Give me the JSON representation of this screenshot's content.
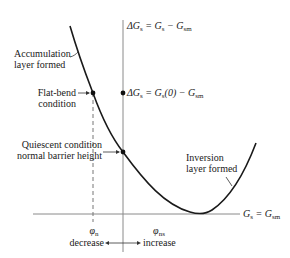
{
  "diagram": {
    "axis_label_vertical": {
      "prefix": "ΔG",
      "sub1": "s",
      "eq": " = G",
      "sub2": "s",
      "minus": " − G",
      "sub3": "sm"
    },
    "axis_label_horizontal": {
      "g": "G",
      "sub1": "s",
      "eq": " = G",
      "sub2": "sm"
    },
    "point_label": {
      "prefix": "ΔG",
      "sub1": "s",
      "eq": " = G",
      "sub2": "s",
      "paren": "(0) − G",
      "sub3": "sm"
    },
    "annotations": {
      "accumulation_line1": "Accumulation",
      "accumulation_line2": "layer formed",
      "flatband_line1": "Flat-bend",
      "flatband_line2": "condition",
      "quiescent_line1": "Quiescent condition",
      "quiescent_line2": "normal barrier height",
      "inversion_line1": "Inversion",
      "inversion_line2": "layer formed"
    },
    "ticks": {
      "phi_n": "φ",
      "phi_n_sub": "n",
      "phi_ns": "φ",
      "phi_ns_sub": "ns"
    },
    "direction": {
      "left": "decrease",
      "right": "increase"
    },
    "colors": {
      "curve": "#1a1a1a",
      "axis": "#777777",
      "text": "#1a1a1a"
    }
  }
}
